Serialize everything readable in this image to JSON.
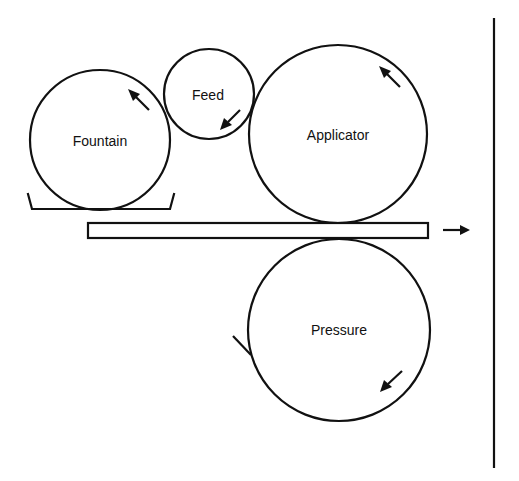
{
  "diagram": {
    "rolls": [
      {
        "id": "fountain",
        "label": "Fountain",
        "cx": 100,
        "cy": 140,
        "r": 70
      },
      {
        "id": "feed",
        "label": "Feed",
        "cx": 209,
        "cy": 94,
        "r": 45
      },
      {
        "id": "applicator",
        "label": "Applicator",
        "cx": 338,
        "cy": 134,
        "r": 89
      },
      {
        "id": "pressure",
        "label": "Pressure",
        "cx": 339,
        "cy": 330,
        "r": 91
      }
    ],
    "web": {
      "x": 88,
      "y": 223,
      "width": 340,
      "height": 15
    },
    "web_direction": "right",
    "labels": {
      "fountain": "Fountain",
      "feed": "Feed",
      "applicator": "Applicator",
      "pressure": "Pressure"
    },
    "rotation_arrows": {
      "fountain": "counterclockwise",
      "feed": "counterclockwise",
      "applicator": "counterclockwise",
      "pressure": "clockwise"
    }
  }
}
